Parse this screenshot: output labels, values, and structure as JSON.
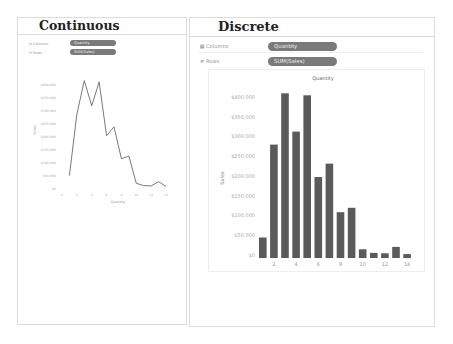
{
  "left_panel": {
    "title": "Continuous",
    "shelves": {
      "columns": {
        "icon": "columns-icon",
        "label": "Columns",
        "pill": "Quantity"
      },
      "rows": {
        "icon": "rows-icon",
        "label": "Rows",
        "pill": "SUM(Sales)"
      }
    }
  },
  "right_panel": {
    "title": "Discrete",
    "shelves": {
      "columns": {
        "icon": "columns-icon",
        "label": "Columns",
        "pill": "Quantity"
      },
      "rows": {
        "icon": "rows-icon",
        "label": "Rows",
        "pill": "SUM(Sales)"
      }
    }
  },
  "colors": {
    "pill": "#7a7a7a",
    "bar": "#5a5a5a",
    "line": "#6a6a6a",
    "border": "#dcdcdc",
    "axis_text": "#aaaaaa"
  },
  "chart_data": [
    {
      "type": "line",
      "title": "",
      "xlabel": "Quantity",
      "ylabel": "Sales",
      "x": [
        1,
        2,
        3,
        4,
        5,
        6,
        7,
        8,
        9,
        10,
        11,
        12,
        13,
        14
      ],
      "x_ticks": [
        "0",
        "2",
        "4",
        "6",
        "8",
        "10",
        "12",
        "14"
      ],
      "y_ticks": [
        "$0",
        "$50,000",
        "$100,000",
        "$150,000",
        "$200,000",
        "$250,000",
        "$300,000",
        "$350,000",
        "$400,000"
      ],
      "ylim": [
        0,
        420000
      ],
      "series": [
        {
          "name": "SUM(Sales)",
          "values": [
            52000,
            287000,
            417000,
            320000,
            412000,
            205000,
            239000,
            116000,
            127000,
            22000,
            13000,
            12000,
            28000,
            10000
          ]
        }
      ],
      "grid": false,
      "legend": "none"
    },
    {
      "type": "bar",
      "title": "Quantity",
      "xlabel": "",
      "ylabel": "Sales",
      "categories": [
        "1",
        "2",
        "3",
        "4",
        "5",
        "6",
        "7",
        "8",
        "9",
        "10",
        "11",
        "12",
        "13",
        "14"
      ],
      "x_tick_labels": [
        "2",
        "4",
        "6",
        "8",
        "10",
        "12",
        "14"
      ],
      "y_ticks": [
        "$0",
        "$50,000",
        "$100,000",
        "$150,000",
        "$200,000",
        "$250,000",
        "$300,000",
        "$350,000",
        "$400,000"
      ],
      "ylim": [
        0,
        420000
      ],
      "values": [
        52000,
        287000,
        417000,
        320000,
        412000,
        205000,
        239000,
        116000,
        127000,
        22000,
        13000,
        12000,
        28000,
        10000
      ],
      "grid": false,
      "legend": "none"
    }
  ]
}
